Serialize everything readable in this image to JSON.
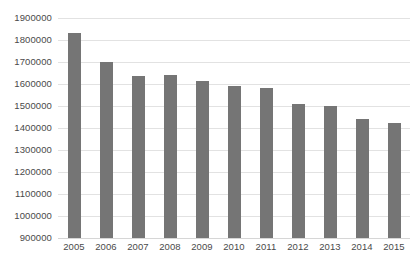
{
  "chart_data": {
    "type": "bar",
    "title": "",
    "subtitle": "",
    "xlabel": "",
    "ylabel": "",
    "categories": [
      "2005",
      "2006",
      "2007",
      "2008",
      "2009",
      "2010",
      "2011",
      "2012",
      "2013",
      "2014",
      "2015"
    ],
    "values": [
      1830000,
      1700000,
      1635000,
      1640000,
      1615000,
      1590000,
      1580000,
      1510000,
      1500000,
      1440000,
      1425000
    ],
    "series": [
      {
        "name": "",
        "values": [
          1830000,
          1700000,
          1635000,
          1640000,
          1615000,
          1590000,
          1580000,
          1510000,
          1500000,
          1440000,
          1425000
        ]
      }
    ],
    "ylim": [
      900000,
      1900000
    ],
    "ytick_values": [
      900000,
      1000000,
      1100000,
      1200000,
      1300000,
      1400000,
      1500000,
      1600000,
      1700000,
      1800000,
      1900000
    ],
    "ytick_labels": [
      "900000",
      "1000000",
      "1100000",
      "1200000",
      "1300000",
      "1400000",
      "1500000",
      "1600000",
      "1700000",
      "1800000",
      "1900000"
    ],
    "grid": true,
    "grid_axis": "y",
    "legend": false,
    "legend_position": "none",
    "bar_color": "#757575",
    "gridline_color": "#e2e2e2",
    "background_color": "#ffffff",
    "tick_label_color": "#4a4a4a",
    "annotations": []
  }
}
